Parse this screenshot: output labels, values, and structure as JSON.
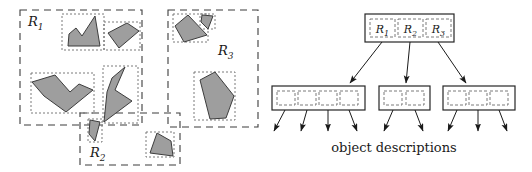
{
  "figure": {
    "caption": "object descriptions",
    "colors": {
      "shape_fill": "#9e9e9e",
      "shape_stroke": "#3d3d3d",
      "region_dash": "#3d3d3d",
      "mbr_dot": "#6b6b6b",
      "node_border": "#262626",
      "arrow": "#1a1a1a",
      "background": "#ffffff"
    }
  },
  "spatial": {
    "regions": [
      {
        "id": "R1",
        "label": "R",
        "sub": "1",
        "label_x": 28,
        "label_y": 26,
        "x": 20,
        "y": 10,
        "w": 122,
        "h": 115
      },
      {
        "id": "R2",
        "label": "R",
        "sub": "2",
        "label_x": 90,
        "label_y": 157,
        "x": 80,
        "y": 113,
        "w": 100,
        "h": 52
      },
      {
        "id": "R3",
        "label": "R",
        "sub": "3",
        "label_x": 218,
        "label_y": 55,
        "x": 168,
        "y": 10,
        "w": 90,
        "h": 117
      }
    ],
    "object_boxes": [
      {
        "x": 62,
        "y": 14,
        "w": 42,
        "h": 36
      },
      {
        "x": 104,
        "y": 22,
        "w": 36,
        "h": 28
      },
      {
        "x": 31,
        "y": 73,
        "w": 63,
        "h": 40
      },
      {
        "x": 103,
        "y": 66,
        "w": 35,
        "h": 57
      },
      {
        "x": 88,
        "y": 119,
        "w": 14,
        "h": 23
      },
      {
        "x": 146,
        "y": 132,
        "w": 28,
        "h": 25
      },
      {
        "x": 173,
        "y": 14,
        "w": 35,
        "h": 28
      },
      {
        "x": 200,
        "y": 14,
        "w": 15,
        "h": 15
      },
      {
        "x": 194,
        "y": 72,
        "w": 41,
        "h": 48
      }
    ],
    "shapes": [
      {
        "name": "arrow-polygon-1",
        "points": "69,34 76,28 82,36 95,16 100,46 68,46"
      },
      {
        "name": "quad-polygon-2",
        "points": "108,33 127,23 139,31 119,48"
      },
      {
        "name": "wide-arrow-polygon-3",
        "points": "32,82 55,75 70,92 79,84 93,90 66,112 44,96"
      },
      {
        "name": "zigzag-polygon-4",
        "points": "125,67 115,90 132,101 104,122 107,92 112,78"
      },
      {
        "name": "small-triangle-5",
        "points": "90,120 100,122 95,141 89,134"
      },
      {
        "name": "quad-polygon-6",
        "points": "157,133 171,141 173,156 150,153"
      },
      {
        "name": "quad-polygon-7",
        "points": "175,26 188,15 207,35 184,42"
      },
      {
        "name": "small-triangle-8",
        "points": "202,15 213,16 208,29 201,22"
      },
      {
        "name": "pentagon-polygon-9",
        "points": "200,80 215,72 234,96 226,118 210,119"
      }
    ]
  },
  "tree": {
    "root": {
      "x": 99,
      "y": 14,
      "w": 89,
      "h": 28,
      "cells": [
        {
          "label": "R",
          "sub": "1",
          "x": 104,
          "y": 19,
          "w": 25,
          "h": 18
        },
        {
          "label": "R",
          "sub": "2",
          "x": 132,
          "y": 19,
          "w": 25,
          "h": 18
        },
        {
          "label": "R",
          "sub": "3",
          "x": 160,
          "y": 19,
          "w": 25,
          "h": 18
        }
      ]
    },
    "leaves": [
      {
        "id": "leaf-R1",
        "x": 6,
        "y": 86,
        "w": 93,
        "h": 24,
        "entry_count": 4,
        "cells": [
          {
            "x": 11,
            "y": 91,
            "w": 18,
            "h": 14
          },
          {
            "x": 32,
            "y": 91,
            "w": 18,
            "h": 14
          },
          {
            "x": 53,
            "y": 91,
            "w": 18,
            "h": 14
          },
          {
            "x": 74,
            "y": 91,
            "w": 18,
            "h": 14
          }
        ]
      },
      {
        "id": "leaf-R2",
        "x": 113,
        "y": 86,
        "w": 51,
        "h": 24,
        "entry_count": 2,
        "cells": [
          {
            "x": 118,
            "y": 91,
            "w": 18,
            "h": 14
          },
          {
            "x": 140,
            "y": 91,
            "w": 18,
            "h": 14
          }
        ]
      },
      {
        "id": "leaf-R3",
        "x": 177,
        "y": 86,
        "w": 72,
        "h": 24,
        "entry_count": 3,
        "cells": [
          {
            "x": 182,
            "y": 91,
            "w": 18,
            "h": 14
          },
          {
            "x": 203,
            "y": 91,
            "w": 18,
            "h": 14
          },
          {
            "x": 224,
            "y": 91,
            "w": 18,
            "h": 14
          }
        ]
      }
    ],
    "root_to_leaf_arrows": [
      {
        "from_x": 116,
        "from_y": 42,
        "to_x": 84,
        "to_y": 83
      },
      {
        "from_x": 144,
        "from_y": 42,
        "to_x": 140,
        "to_y": 83
      },
      {
        "from_x": 172,
        "from_y": 42,
        "to_x": 200,
        "to_y": 83
      }
    ],
    "leaf_to_object_arrows": [
      {
        "from_x": 19,
        "from_y": 110,
        "to_x": 8,
        "to_y": 131
      },
      {
        "from_x": 41,
        "from_y": 110,
        "to_x": 35,
        "to_y": 131
      },
      {
        "from_x": 62,
        "from_y": 110,
        "to_x": 62,
        "to_y": 131
      },
      {
        "from_x": 83,
        "from_y": 110,
        "to_x": 91,
        "to_y": 131
      },
      {
        "from_x": 127,
        "from_y": 110,
        "to_x": 118,
        "to_y": 131
      },
      {
        "from_x": 149,
        "from_y": 110,
        "to_x": 157,
        "to_y": 131
      },
      {
        "from_x": 191,
        "from_y": 110,
        "to_x": 182,
        "to_y": 131
      },
      {
        "from_x": 212,
        "from_y": 110,
        "to_x": 212,
        "to_y": 131
      },
      {
        "from_x": 233,
        "from_y": 110,
        "to_x": 241,
        "to_y": 131
      }
    ],
    "caption": {
      "text": "object descriptions",
      "x": 128,
      "y": 152
    }
  }
}
